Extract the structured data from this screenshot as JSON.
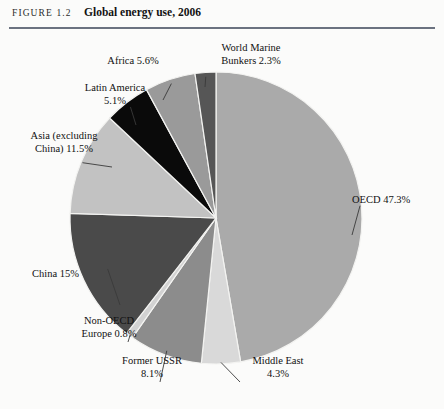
{
  "figure": {
    "number": "FIGURE 1.2",
    "title": "Global energy use, 2006"
  },
  "chart_data": {
    "type": "pie",
    "title": "Global energy use, 2006",
    "subtitle": "",
    "xlabel": "",
    "ylabel": "",
    "legend_position": "none",
    "grid": false,
    "units": "percent of global energy use",
    "start_angle_deg": 0,
    "direction": "clockwise",
    "categories": [
      "OECD",
      "Middle East",
      "Former USSR",
      "Non-OECD Europe",
      "China",
      "Asia (excluding China)",
      "Latin America",
      "Africa",
      "World Marine Bunkers"
    ],
    "values": [
      47.3,
      4.3,
      8.1,
      0.8,
      15.0,
      11.5,
      5.1,
      5.6,
      2.3
    ],
    "slices": [
      {
        "name": "OECD",
        "value": 47.3,
        "label": "OECD 47.3%",
        "color": "#aaaaaa"
      },
      {
        "name": "Middle East",
        "value": 4.3,
        "label": "Middle East\n4.3%",
        "color": "#d9d9d9"
      },
      {
        "name": "Former USSR",
        "value": 8.1,
        "label": "Former USSR\n8.1%",
        "color": "#8c8c8c"
      },
      {
        "name": "Non-OECD Europe",
        "value": 0.8,
        "label": "Non-OECD\nEurope 0.8%",
        "color": "#d2d2d2"
      },
      {
        "name": "China",
        "value": 15.0,
        "label": "China 15%",
        "color": "#4a4a4a"
      },
      {
        "name": "Asia (excluding China)",
        "value": 11.5,
        "label": "Asia (excluding\nChina) 11.5%",
        "color": "#c2c2c2"
      },
      {
        "name": "Latin America",
        "value": 5.1,
        "label": "Latin America\n5.1%",
        "color": "#0a0a0a"
      },
      {
        "name": "Africa",
        "value": 5.6,
        "label": "Africa 5.6%",
        "color": "#9a9a9a"
      },
      {
        "name": "World Marine Bunkers",
        "value": 2.3,
        "label": "World Marine\nBunkers 2.3%",
        "color": "#565656"
      }
    ]
  },
  "labels": {
    "oecd": "OECD 47.3%",
    "middle_east": "Middle East\n4.3%",
    "former_ussr": "Former USSR\n8.1%",
    "non_oecd_europe": "Non-OECD\nEurope 0.8%",
    "china": "China 15%",
    "asia": "Asia (excluding\nChina) 11.5%",
    "latin_america": "Latin America\n5.1%",
    "africa": "Africa 5.6%",
    "world_marine_bunkers": "World Marine\nBunkers 2.3%"
  },
  "style": {
    "page_background": "#fbfbfa",
    "rule_color": "#6b7280",
    "slice_outline": "#f3f3f1",
    "leader_line_color": "#3a3a3a",
    "text_color": "#111111"
  }
}
